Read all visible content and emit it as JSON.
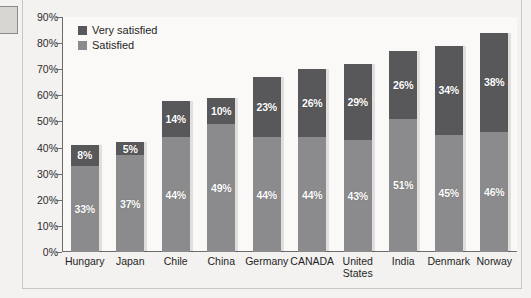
{
  "chart_data": {
    "type": "bar",
    "subtype": "stacked-bar",
    "title": "",
    "xlabel": "",
    "ylabel": "",
    "ylim": [
      0,
      90
    ],
    "ytick_labels": [
      "0%",
      "10%",
      "20%",
      "30%",
      "40%",
      "50%",
      "60%",
      "70%",
      "80%",
      "90%"
    ],
    "ytick_values": [
      0,
      10,
      20,
      30,
      40,
      50,
      60,
      70,
      80,
      90
    ],
    "grid": false,
    "legend_position": "top-left",
    "categories": [
      "Hungary",
      "Japan",
      "Chile",
      "China",
      "Germany",
      "CANADA",
      "United States",
      "India",
      "Denmark",
      "Norway"
    ],
    "series": [
      {
        "name": "Satisfied",
        "color": "#8b8b8d",
        "values": [
          33,
          37,
          44,
          49,
          44,
          44,
          43,
          51,
          45,
          46
        ],
        "labels": [
          "33%",
          "37%",
          "44%",
          "49%",
          "44%",
          "44%",
          "43%",
          "51%",
          "45%",
          "46%"
        ]
      },
      {
        "name": "Very satisfied",
        "color": "#58585a",
        "values": [
          8,
          5,
          14,
          10,
          23,
          26,
          29,
          26,
          34,
          38
        ],
        "labels": [
          "8%",
          "5%",
          "14%",
          "10%",
          "23%",
          "26%",
          "29%",
          "26%",
          "34%",
          "38%"
        ]
      }
    ],
    "totals": [
      41,
      42,
      58,
      59,
      67,
      70,
      72,
      77,
      79,
      84
    ]
  },
  "legend": {
    "items": [
      {
        "label": "Very satisfied",
        "color": "#58585a"
      },
      {
        "label": "Satisfied",
        "color": "#8b8b8d"
      }
    ]
  },
  "colors": {
    "very_satisfied": "#58585a",
    "satisfied": "#8b8b8d",
    "axis": "#6e6c6a",
    "plot_background": "#faf9f7",
    "page_background": "#f3f2f0"
  }
}
